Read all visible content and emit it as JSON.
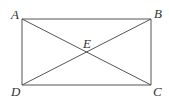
{
  "diagram": {
    "title": "",
    "points": {
      "A": {
        "label": "A",
        "x": 22,
        "y": 19
      },
      "B": {
        "label": "B",
        "x": 151,
        "y": 19
      },
      "C": {
        "label": "C",
        "x": 151,
        "y": 85
      },
      "D": {
        "label": "D",
        "x": 22,
        "y": 85
      },
      "E": {
        "label": "E",
        "x": 86.5,
        "y": 52
      }
    },
    "segments": [
      [
        "A",
        "B"
      ],
      [
        "B",
        "C"
      ],
      [
        "C",
        "D"
      ],
      [
        "D",
        "A"
      ],
      [
        "A",
        "C"
      ],
      [
        "B",
        "D"
      ]
    ],
    "colors": {
      "line": "#555555",
      "text": "#333333",
      "background": "#ffffff"
    }
  }
}
